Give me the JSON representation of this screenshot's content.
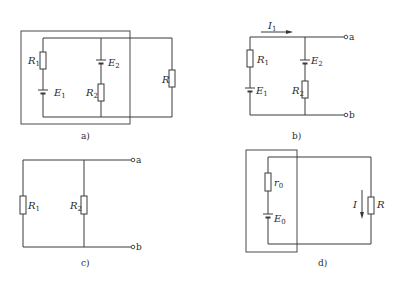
{
  "figure": {
    "panels": [
      {
        "id": "a",
        "caption": "a)",
        "labels": {
          "R1": "R",
          "R1_sub": "1",
          "E1": "E",
          "E1_sub": "1",
          "E2": "E",
          "E2_sub": "2",
          "R2": "R",
          "R2_sub": "2",
          "R": "R"
        },
        "description": "Two source branches (R1+E1, E2+R2) enclosed in a dash-dot box, connected in parallel to load resistor R"
      },
      {
        "id": "b",
        "caption": "b)",
        "labels": {
          "I1": "I",
          "I1_sub": "1",
          "R1": "R",
          "R1_sub": "1",
          "E1": "E",
          "E1_sub": "1",
          "E2": "E",
          "E2_sub": "2",
          "R2": "R",
          "R2_sub": "2"
        },
        "terminals": [
          "a",
          "b"
        ],
        "description": "Two-source network with current I1 and output terminals a, b"
      },
      {
        "id": "c",
        "caption": "c)",
        "labels": {
          "R1": "R",
          "R1_sub": "1",
          "R2": "R",
          "R2_sub": "2"
        },
        "terminals": [
          "a",
          "b"
        ],
        "description": "R1 and R2 in parallel between terminals a and b"
      },
      {
        "id": "d",
        "caption": "d)",
        "labels": {
          "r0": "r",
          "r0_sub": "0",
          "E0": "E",
          "E0_sub": "0",
          "I": "I",
          "R": "R"
        },
        "description": "Equivalent source (r0 + E0) in dash-dot box driving load R with current I"
      }
    ]
  },
  "colors": {
    "line": "#3a3a3a",
    "background": "#ffffff"
  }
}
